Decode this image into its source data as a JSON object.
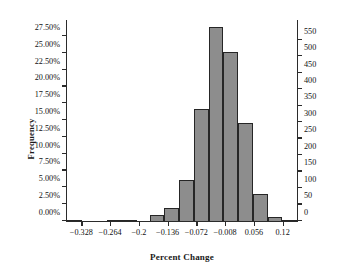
{
  "chart_data": {
    "type": "bar",
    "title": "",
    "subtitle": "",
    "xlabel": "Percent Change",
    "ylabel": "Frequency",
    "grid": false,
    "legend": null,
    "bin_width": 0.032,
    "x_range": [
      -0.36,
      0.152
    ],
    "xlim": [
      -0.36,
      0.152
    ],
    "ylim": [
      0,
      29.9
    ],
    "y_right_lim": [
      0,
      610
    ],
    "x_ticks": [
      "-0.328",
      "-0.264",
      "-0.2",
      "-0.136",
      "-0.072",
      "-0.008",
      "0.056",
      "0.12"
    ],
    "x_tick_values": [
      -0.328,
      -0.264,
      -0.2,
      -0.136,
      -0.072,
      -0.008,
      0.056,
      0.12
    ],
    "y_left_ticks": [
      "0.00%",
      "2.50%",
      "5.00%",
      "7.50%",
      "10.00%",
      "12.50%",
      "15.00%",
      "17.50%",
      "20.00%",
      "22.50%",
      "25.00%",
      "27.50%"
    ],
    "y_left_tick_values": [
      0,
      2.5,
      5,
      7.5,
      10,
      12.5,
      15,
      17.5,
      20,
      22.5,
      25,
      27.5
    ],
    "y_right_ticks": [
      "0",
      "50",
      "100",
      "150",
      "200",
      "250",
      "300",
      "350",
      "400",
      "450",
      "500",
      "550"
    ],
    "y_right_tick_values": [
      0,
      50,
      100,
      150,
      200,
      250,
      300,
      350,
      400,
      450,
      500,
      550
    ],
    "categories": [
      "-0.344",
      "-0.312",
      "-0.28",
      "-0.248",
      "-0.216",
      "-0.184",
      "-0.152",
      "-0.12",
      "-0.088",
      "-0.056",
      "-0.024",
      "0.008",
      "0.04",
      "0.072",
      "0.104",
      "0.136"
    ],
    "bin_centers": [
      -0.344,
      -0.312,
      -0.28,
      -0.248,
      -0.216,
      -0.184,
      -0.152,
      -0.12,
      -0.088,
      -0.056,
      -0.024,
      0.008,
      0.04,
      0.072,
      0.104,
      0.136
    ],
    "values": [
      0.1,
      0.0,
      0.0,
      0.15,
      0.2,
      0.0,
      0.85,
      2.0,
      6.1,
      16.7,
      28.8,
      25.1,
      14.6,
      4.0,
      0.6,
      0.15
    ],
    "counts": [
      2,
      0,
      0,
      3,
      4,
      0,
      17,
      41,
      124,
      341,
      588,
      512,
      298,
      82,
      12,
      3
    ],
    "series": [
      {
        "name": "Frequency",
        "values": [
          0.1,
          0.0,
          0.0,
          0.15,
          0.2,
          0.0,
          0.85,
          2.0,
          6.1,
          16.7,
          28.8,
          25.1,
          14.6,
          4.0,
          0.6,
          0.15
        ]
      }
    ],
    "bar_fill_color": "#8d8d8d",
    "bar_edge_color": "#262626",
    "axis_color": "#2b2b2b",
    "background_color": "#ffffff"
  }
}
